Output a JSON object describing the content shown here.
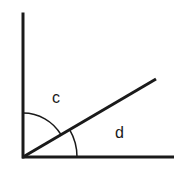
{
  "diagram": {
    "type": "angle-diagram",
    "colors": {
      "stroke": "#1a1a1a",
      "background": "#ffffff"
    },
    "vertex": {
      "x": 23,
      "y": 157
    },
    "rays": [
      {
        "name": "vertical-ray",
        "x2": 23,
        "y2": 14
      },
      {
        "name": "horizontal-ray",
        "x2": 174,
        "y2": 157
      },
      {
        "name": "diagonal-ray",
        "x2": 156,
        "y2": 79
      }
    ],
    "angles": [
      {
        "label": "c",
        "between": [
          "vertical-ray",
          "diagonal-ray"
        ],
        "arc_radius": 44
      },
      {
        "label": "d",
        "between": [
          "diagonal-ray",
          "horizontal-ray"
        ],
        "arc_radius": 54
      }
    ]
  }
}
